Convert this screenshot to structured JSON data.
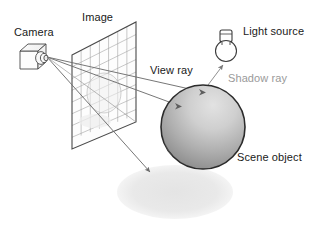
{
  "figure": {
    "type": "diagram",
    "background": "#ffffff"
  },
  "labels": {
    "camera": "Camera",
    "image": "Image",
    "light_source": "Light source",
    "view_ray": "View ray",
    "shadow_ray": "Shadow ray",
    "scene_object": "Scene object"
  },
  "colors": {
    "line": "#3c3c3c",
    "ray": "#6b6b6b",
    "grid": "#9d9d9d",
    "text_dark": "#1a1a1a",
    "text_gray": "#9a9a9a",
    "sphere_light": "#d8d8d8",
    "sphere_dark": "#8e8e8e",
    "sphere_outline": "#2b2b2b",
    "shadow": "#e9e9e9",
    "plane_outline": "#4a4a4a"
  },
  "geometry": {
    "camera": {
      "x": 20,
      "y": 44,
      "w": 32,
      "h": 22,
      "lens_cx": 45,
      "lens_cy": 57
    },
    "image_plane": {
      "corners": [
        [
          72,
          55
        ],
        [
          136,
          22
        ],
        [
          136,
          122
        ],
        [
          72,
          149
        ]
      ],
      "grid_cols": 7,
      "grid_rows": 8,
      "projected_circle": {
        "cx": 104,
        "cy": 93,
        "rx": 17,
        "ry": 20
      }
    },
    "sphere": {
      "cx": 203,
      "cy": 127,
      "r": 42
    },
    "shadow_ellipse": {
      "cx": 175,
      "cy": 192,
      "rx": 58,
      "ry": 27
    },
    "bulb": {
      "cx": 226,
      "cy": 52,
      "r": 11,
      "base_w": 11,
      "base_h": 12
    },
    "rays": [
      {
        "name": "view-ray-upper",
        "from": [
          47,
          57
        ],
        "to": [
          205,
          92
        ]
      },
      {
        "name": "view-ray-lower",
        "from": [
          47,
          57
        ],
        "to": [
          180,
          106
        ]
      },
      {
        "name": "view-ray-shadow",
        "from": [
          47,
          57
        ],
        "to": [
          149,
          173
        ]
      },
      {
        "name": "shadow-ray",
        "from": [
          203,
          92
        ],
        "to": [
          222,
          64
        ]
      }
    ]
  },
  "label_positions": {
    "camera": {
      "x": 14,
      "y": 27
    },
    "image": {
      "x": 82,
      "y": 12
    },
    "light_source": {
      "x": 243,
      "y": 26
    },
    "view_ray": {
      "x": 150,
      "y": 66
    },
    "shadow_ray": {
      "x": 227,
      "y": 73
    },
    "scene_object": {
      "x": 237,
      "y": 152
    }
  }
}
